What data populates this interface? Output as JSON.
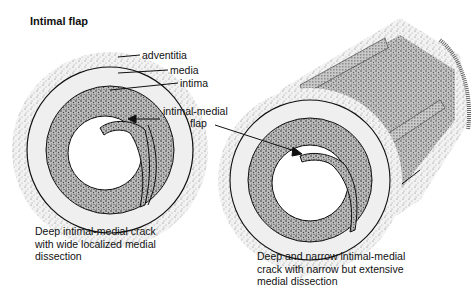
{
  "title": "Intimal flap",
  "labels": {
    "adventitia": "adventitia",
    "media": "media",
    "intima": "intima",
    "flap_line1": "intimal-medial",
    "flap_line2": "flap"
  },
  "captions": {
    "left": {
      "line1": "Deep intimal-medial crack",
      "line2": "with wide localized medial",
      "line3": "dissection"
    },
    "right": {
      "line1": "Deep and narrow intimal-medial",
      "line2": "crack with narrow but extensive",
      "line3": "medial dissection"
    }
  },
  "colors": {
    "ink": "#111111",
    "adventitia": "#d4d4d4",
    "media": "#ececec",
    "intima": "#8a8a8a",
    "lumen": "#ffffff"
  }
}
